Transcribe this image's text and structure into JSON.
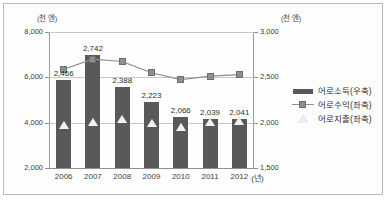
{
  "axes": {
    "left_unit": "(천 엔)",
    "right_unit": "(천 엔)",
    "x_unit": "(년)",
    "left_ticks": [
      "8,000",
      "6,000",
      "4,000",
      "2,000"
    ],
    "right_ticks": [
      "3,000",
      "2,500",
      "2,000",
      "1,500"
    ]
  },
  "legend": [
    {
      "label": "어로소득(우축)",
      "marker": "bar-marker",
      "color": "#595959"
    },
    {
      "label": "어로수익(좌축)",
      "marker": "line-square-marker",
      "color": "#8e8e8e"
    },
    {
      "label": "어로지출(좌축)",
      "marker": "triangle-marker",
      "color": "#efefef"
    }
  ],
  "chart_data": {
    "type": "bar",
    "title": "",
    "xlabel": "(년)",
    "ylabel": "(천 엔)",
    "categories": [
      "2006",
      "2007",
      "2008",
      "2009",
      "2010",
      "2011",
      "2012"
    ],
    "grid": true,
    "legend_position": "right",
    "ylim": [
      2000,
      8000
    ],
    "y2lim": [
      1500,
      3000
    ],
    "yticks": [
      2000,
      4000,
      6000,
      8000
    ],
    "y2ticks": [
      1500,
      2000,
      2500,
      3000
    ],
    "series": [
      {
        "name": "어로소득(우축)",
        "type": "bar",
        "axis": "right",
        "values": [
          2466,
          2742,
          2388,
          2223,
          2066,
          2039,
          2041
        ],
        "labels": [
          "2,466",
          "2,742",
          "2,388",
          "2,223",
          "2,066",
          "2,039",
          "2,041"
        ]
      },
      {
        "name": "어로수익(좌축)",
        "type": "line",
        "axis": "left",
        "values": [
          6360,
          6800,
          6700,
          6200,
          5900,
          6050,
          6120
        ]
      },
      {
        "name": "어로지출(좌축)",
        "type": "scatter",
        "axis": "left",
        "values": [
          3900,
          4030,
          4180,
          4000,
          3820,
          4050,
          4060
        ]
      }
    ]
  }
}
